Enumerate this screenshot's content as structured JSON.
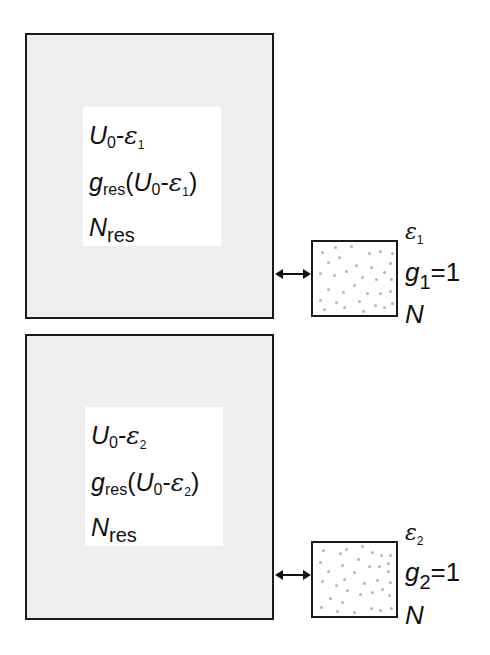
{
  "figure": {
    "panels": [
      {
        "id": 1,
        "reservoir": {
          "energy": {
            "base": "U",
            "base_sub": "0",
            "op": "-",
            "eps": "ε",
            "eps_sub": "1"
          },
          "degeneracy": {
            "g": "g",
            "g_sub": "res",
            "open": "(",
            "base": "U",
            "base_sub": "0",
            "op": "-",
            "eps": "ε",
            "eps_sub": "1",
            "close": ")"
          },
          "particles": {
            "N": "N",
            "N_sub": "res"
          }
        },
        "system": {
          "energy": {
            "eps": "ε",
            "eps_sub": "1"
          },
          "degeneracy": {
            "g": "g",
            "g_sub": "1",
            "eq": "=1"
          },
          "particles": "N"
        }
      },
      {
        "id": 2,
        "reservoir": {
          "energy": {
            "base": "U",
            "base_sub": "0",
            "op": "-",
            "eps": "ε",
            "eps_sub": "2"
          },
          "degeneracy": {
            "g": "g",
            "g_sub": "res",
            "open": "(",
            "base": "U",
            "base_sub": "0",
            "op": "-",
            "eps": "ε",
            "eps_sub": "2",
            "close": ")"
          },
          "particles": {
            "N": "N",
            "N_sub": "res"
          }
        },
        "system": {
          "energy": {
            "eps": "ε",
            "eps_sub": "2"
          },
          "degeneracy": {
            "g": "g",
            "g_sub": "2",
            "eq": "=1"
          },
          "particles": "N"
        }
      }
    ],
    "connector": "double-headed-arrow",
    "colors": {
      "reservoir_fill": "#efefef",
      "border": "#1a1a1a",
      "particle_dot": "#b5b5b5",
      "label_bg": "#ffffff"
    }
  }
}
